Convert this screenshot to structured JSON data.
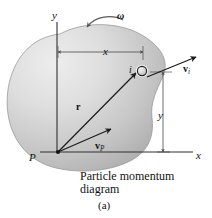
{
  "figure": {
    "caption_line1": "Particle momentum",
    "caption_line2": "diagram",
    "number": "(a)"
  },
  "axes": {
    "y_label": "y",
    "x_label": "x",
    "origin_label": "P"
  },
  "dimensions": {
    "horizontal_label": "x",
    "vertical_label": "y"
  },
  "annotations": {
    "angular_velocity": "ω",
    "particle_index": "i",
    "position_vector": "r",
    "velocity_p_symbol": "v",
    "velocity_p_subscript": "P",
    "velocity_i_symbol": "v",
    "velocity_i_subscript": "i"
  },
  "colors": {
    "background": "#ffffff",
    "body_fill_light": "#e4e4e4",
    "body_fill_mid": "#c9c9c9",
    "body_fill_dark": "#a8a8a8",
    "body_outline": "#8f8f8f",
    "line": "#222222",
    "axis": "#333333",
    "dim_line": "#555555",
    "particle_fill": "#dcdcdc",
    "particle_outline": "#222222",
    "text": "#111111"
  },
  "icons": {
    "rotation_arc": "curved-arrow-icon",
    "particle": "particle-circle-icon"
  }
}
